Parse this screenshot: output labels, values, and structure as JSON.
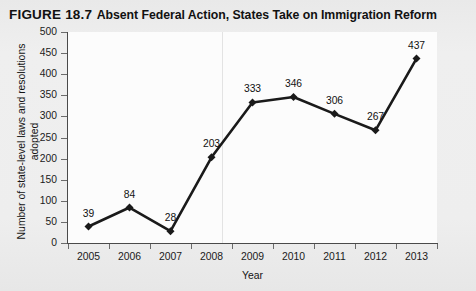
{
  "title": {
    "number": "FIGURE 18.7",
    "caption": "Absent Federal Action, States Take on Immigration Reform"
  },
  "chart_data": {
    "type": "line",
    "title": "FIGURE 18.7 Absent Federal Action, States Take on Immigration Reform",
    "xlabel": "Year",
    "ylabel": "Number of state-level laws and resolutions adopted",
    "categories": [
      "2005",
      "2006",
      "2007",
      "2008",
      "2009",
      "2010",
      "2011",
      "2012",
      "2013"
    ],
    "values": [
      39,
      84,
      28,
      203,
      333,
      346,
      306,
      267,
      437
    ],
    "point_labels": [
      "39",
      "84",
      "28",
      "203",
      "333",
      "346",
      "306",
      "267",
      "437"
    ],
    "ylim": [
      0,
      500
    ],
    "ytick_step": 50,
    "ytick_labels": [
      "500",
      "450",
      "400",
      "350",
      "300",
      "250",
      "200",
      "150",
      "100",
      "50",
      "0"
    ],
    "grid": false,
    "legend": null,
    "series_color": "#1a1a1a",
    "marker": "diamond",
    "plot_background": "#fcfcfc",
    "page_background": "#eeeeee"
  },
  "axis_labels": {
    "y_line1": "Number of state-level laws and resolutions",
    "y_line2": "adopted",
    "x_title": "Year"
  }
}
